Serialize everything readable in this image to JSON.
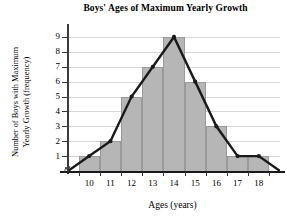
{
  "chart_data": {
    "type": "bar",
    "title": "Boys' Ages of Maximum Yearly Growth",
    "xlabel": "Ages (years)",
    "ylabel": "Number of Boys with Maximum Yearly Growth (frequency)",
    "ylabel_line1": "Number of Boys with Maximum",
    "ylabel_line2": "Yearly Growth (frequency)",
    "categories": [
      "10",
      "11",
      "12",
      "13",
      "14",
      "15",
      "16",
      "17",
      "18"
    ],
    "values": [
      1,
      2,
      5,
      7,
      9,
      6,
      3,
      1,
      1
    ],
    "ytick_labels": [
      "1",
      "2",
      "3",
      "4",
      "5",
      "6",
      "7",
      "8",
      "9"
    ],
    "ytick_values": [
      1,
      2,
      3,
      4,
      5,
      6,
      7,
      8,
      9
    ],
    "ylim": [
      0,
      9.6
    ],
    "xlim": [
      9,
      19
    ],
    "grid": true,
    "legend": null,
    "overlay": {
      "name": "frequency polygon",
      "x": [
        9,
        10,
        11,
        12,
        13,
        14,
        15,
        16,
        17,
        18,
        19
      ],
      "y": [
        0,
        1,
        2,
        5,
        7,
        9,
        6,
        3,
        1,
        1,
        0
      ]
    },
    "bar_color": "#b6b6b6",
    "line_color": "#1a1a1a",
    "grid_color": "#d7d7d7",
    "axis_color": "#3a3a3a",
    "axis_break": true
  }
}
